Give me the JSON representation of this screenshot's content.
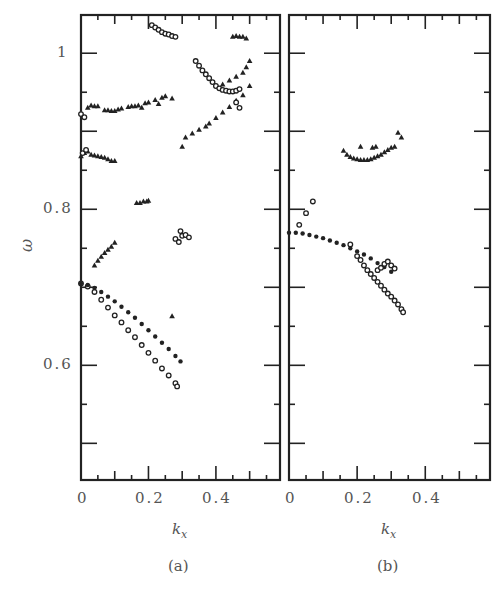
{
  "figure": {
    "ylabel": "ω",
    "panels": [
      {
        "id": "a",
        "caption": "(a)",
        "xlabel": "kx",
        "xlabel_main": "k",
        "xlabel_sub": "x"
      },
      {
        "id": "b",
        "caption": "(b)",
        "xlabel": "kx",
        "xlabel_main": "k",
        "xlabel_sub": "x"
      }
    ],
    "yticks": [
      "1",
      "0.8",
      "0.6"
    ],
    "xticks": [
      "0",
      "0.2",
      "0.4"
    ]
  },
  "chart_data": [
    {
      "type": "scatter",
      "title": "(a)",
      "xlabel": "k_x",
      "ylabel": "ω",
      "xlim": [
        0,
        0.59
      ],
      "ylim": [
        0.453,
        1.049
      ],
      "xticks": [
        0,
        0.2,
        0.4
      ],
      "yticks": [
        0.6,
        0.8,
        1.0
      ],
      "grid": false,
      "legend": null,
      "series": [
        {
          "name": "circles-lower-branch",
          "marker": "circle",
          "x": [
            0,
            0.02,
            0.04,
            0.06,
            0.08,
            0.1,
            0.12,
            0.14,
            0.16,
            0.18,
            0.2,
            0.22,
            0.24,
            0.26,
            0.28,
            0.285
          ],
          "y": [
            0.705,
            0.701,
            0.694,
            0.684,
            0.674,
            0.664,
            0.655,
            0.645,
            0.636,
            0.626,
            0.616,
            0.606,
            0.596,
            0.587,
            0.577,
            0.573
          ]
        },
        {
          "name": "filled-upper-branch",
          "marker": "dot",
          "x": [
            0,
            0.02,
            0.04,
            0.06,
            0.08,
            0.1,
            0.12,
            0.14,
            0.16,
            0.18,
            0.2,
            0.22,
            0.24,
            0.26,
            0.28,
            0.295
          ],
          "y": [
            0.705,
            0.703,
            0.699,
            0.694,
            0.688,
            0.682,
            0.675,
            0.668,
            0.661,
            0.653,
            0.645,
            0.637,
            0.629,
            0.621,
            0.612,
            0.605
          ]
        },
        {
          "name": "triangles-0.74-branch",
          "marker": "triangle",
          "x": [
            0.04,
            0.05,
            0.06,
            0.07,
            0.08,
            0.09,
            0.1
          ],
          "y": [
            0.728,
            0.734,
            0.739,
            0.744,
            0.748,
            0.752,
            0.757
          ]
        },
        {
          "name": "triangles-0.81",
          "marker": "triangle",
          "x": [
            0.165,
            0.175,
            0.185,
            0.195,
            0.2
          ],
          "y": [
            0.808,
            0.808,
            0.81,
            0.81,
            0.811
          ]
        },
        {
          "name": "circles-0.765",
          "marker": "circle",
          "x": [
            0.28,
            0.29,
            0.295,
            0.3,
            0.31,
            0.32
          ],
          "y": [
            0.762,
            0.758,
            0.772,
            0.766,
            0.767,
            0.764
          ]
        },
        {
          "name": "triangle-isolated",
          "marker": "triangle",
          "x": [
            0.27
          ],
          "y": [
            0.663
          ]
        },
        {
          "name": "triangles-0.87-branch",
          "marker": "triangle",
          "x": [
            0,
            0.01,
            0.02,
            0.03,
            0.04,
            0.05,
            0.06,
            0.07,
            0.08,
            0.09,
            0.1
          ],
          "y": [
            0.868,
            0.872,
            0.874,
            0.87,
            0.869,
            0.868,
            0.867,
            0.866,
            0.864,
            0.862,
            0.862
          ]
        },
        {
          "name": "circles-0.87",
          "marker": "circle",
          "x": [
            0.005,
            0.015
          ],
          "y": [
            0.872,
            0.876
          ]
        },
        {
          "name": "triangles-0.93-branch",
          "marker": "triangle",
          "x": [
            0.02,
            0.03,
            0.04,
            0.05,
            0.07,
            0.08,
            0.09,
            0.1,
            0.11,
            0.12,
            0.14,
            0.15,
            0.16,
            0.17,
            0.18,
            0.19,
            0.2,
            0.22,
            0.23,
            0.24,
            0.25,
            0.27
          ],
          "y": [
            0.93,
            0.933,
            0.932,
            0.932,
            0.927,
            0.927,
            0.926,
            0.926,
            0.928,
            0.929,
            0.931,
            0.932,
            0.932,
            0.933,
            0.93,
            0.936,
            0.937,
            0.94,
            0.935,
            0.943,
            0.945,
            0.942
          ]
        },
        {
          "name": "circles-0.92",
          "marker": "circle",
          "x": [
            0.0,
            0.01
          ],
          "y": [
            0.922,
            0.918
          ]
        },
        {
          "name": "triangles-rising-branch",
          "marker": "triangle",
          "x": [
            0.3,
            0.31,
            0.33,
            0.35,
            0.37,
            0.38,
            0.4,
            0.42,
            0.44,
            0.46,
            0.48,
            0.5
          ],
          "y": [
            0.88,
            0.892,
            0.897,
            0.902,
            0.906,
            0.91,
            0.917,
            0.924,
            0.931,
            0.939,
            0.946,
            0.958
          ]
        },
        {
          "name": "triangles-upper-rising",
          "marker": "triangle",
          "x": [
            0.42,
            0.44,
            0.46,
            0.48,
            0.49,
            0.5
          ],
          "y": [
            0.96,
            0.965,
            0.97,
            0.975,
            0.982,
            0.99
          ]
        },
        {
          "name": "circles-V-branch",
          "marker": "circle",
          "x": [
            0.34,
            0.35,
            0.36,
            0.37,
            0.38,
            0.39,
            0.4,
            0.41,
            0.42,
            0.43,
            0.44,
            0.45,
            0.46,
            0.47
          ],
          "y": [
            0.99,
            0.984,
            0.978,
            0.973,
            0.968,
            0.963,
            0.958,
            0.955,
            0.953,
            0.952,
            0.951,
            0.951,
            0.952,
            0.954
          ]
        },
        {
          "name": "circles-0.93",
          "marker": "circle",
          "x": [
            0.46,
            0.47
          ],
          "y": [
            0.937,
            0.93
          ]
        },
        {
          "name": "circles-top",
          "marker": "circle",
          "x": [
            0.21,
            0.22,
            0.23,
            0.24,
            0.25,
            0.26,
            0.27,
            0.28
          ],
          "y": [
            1.036,
            1.033,
            1.03,
            1.027,
            1.025,
            1.024,
            1.022,
            1.021
          ]
        },
        {
          "name": "triangles-top",
          "marker": "triangle",
          "x": [
            0.45,
            0.46,
            0.47,
            0.48,
            0.49
          ],
          "y": [
            1.021,
            1.022,
            1.021,
            1.021,
            1.019
          ]
        }
      ]
    },
    {
      "type": "scatter",
      "title": "(b)",
      "xlabel": "k_x",
      "ylabel": "ω",
      "xlim": [
        0,
        0.59
      ],
      "ylim": [
        0.453,
        1.049
      ],
      "xticks": [
        0,
        0.2,
        0.4
      ],
      "yticks": [
        0.6,
        0.8,
        1.0
      ],
      "grid": false,
      "legend": null,
      "series": [
        {
          "name": "filled-main-branch",
          "marker": "dot",
          "x": [
            0,
            0.02,
            0.04,
            0.06,
            0.08,
            0.1,
            0.12,
            0.14,
            0.16,
            0.18,
            0.2,
            0.22,
            0.24,
            0.26,
            0.28,
            0.3
          ],
          "y": [
            0.77,
            0.77,
            0.769,
            0.767,
            0.765,
            0.763,
            0.76,
            0.757,
            0.754,
            0.75,
            0.746,
            0.742,
            0.737,
            0.731,
            0.726,
            0.72
          ]
        },
        {
          "name": "circles-descending-branch",
          "marker": "circle",
          "x": [
            0.18,
            0.2,
            0.21,
            0.22,
            0.23,
            0.24,
            0.25,
            0.26,
            0.27,
            0.28,
            0.29,
            0.3,
            0.31,
            0.32,
            0.33,
            0.335
          ],
          "y": [
            0.755,
            0.74,
            0.735,
            0.728,
            0.722,
            0.717,
            0.712,
            0.707,
            0.702,
            0.697,
            0.692,
            0.688,
            0.683,
            0.678,
            0.672,
            0.668
          ]
        },
        {
          "name": "loop-0.72",
          "marker": "circle",
          "x": [
            0.26,
            0.27,
            0.28,
            0.29,
            0.3,
            0.31
          ],
          "y": [
            0.722,
            0.725,
            0.73,
            0.733,
            0.728,
            0.724
          ]
        },
        {
          "name": "circles-isolated",
          "marker": "circle",
          "x": [
            0.07,
            0.05,
            0.03
          ],
          "y": [
            0.81,
            0.795,
            0.78
          ]
        },
        {
          "name": "triangles-arc",
          "marker": "triangle",
          "x": [
            0.16,
            0.17,
            0.18,
            0.19,
            0.2,
            0.21,
            0.22,
            0.23,
            0.24,
            0.25,
            0.26,
            0.27,
            0.28,
            0.29,
            0.3,
            0.31
          ],
          "y": [
            0.875,
            0.87,
            0.867,
            0.865,
            0.864,
            0.863,
            0.863,
            0.863,
            0.864,
            0.866,
            0.868,
            0.87,
            0.873,
            0.876,
            0.879,
            0.88
          ]
        },
        {
          "name": "triangles-arc-top",
          "marker": "triangle",
          "x": [
            0.21,
            0.245,
            0.255,
            0.32,
            0.33
          ],
          "y": [
            0.88,
            0.879,
            0.88,
            0.898,
            0.892
          ]
        }
      ]
    }
  ]
}
